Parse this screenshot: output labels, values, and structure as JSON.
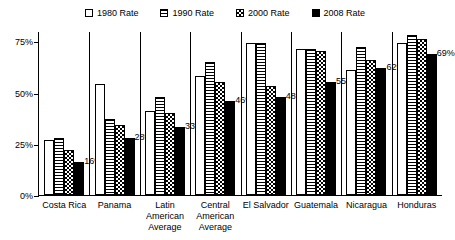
{
  "chart_data": {
    "type": "bar",
    "title": "",
    "subtitle": "",
    "xlabel": "",
    "ylabel": "",
    "ylim": [
      0,
      80
    ],
    "yticks": [
      0,
      25,
      50,
      75
    ],
    "ytick_labels": [
      "0%",
      "25%",
      "50%",
      "75%"
    ],
    "grid": false,
    "legend_position": "top-center",
    "categories": [
      "Costa Rica",
      "Panama",
      "Latin\nAmerican\nAverage",
      "Central\nAmerican\nAverage",
      "El Salvador",
      "Guatemala",
      "Nicaragua",
      "Honduras"
    ],
    "series": [
      {
        "name": "1980 Rate",
        "pattern": "empty",
        "values": [
          27,
          54,
          41,
          58,
          74,
          71,
          61,
          74
        ]
      },
      {
        "name": "1990 Rate",
        "pattern": "horizontal-waves",
        "values": [
          28,
          37,
          48,
          65,
          74,
          71,
          72,
          78
        ]
      },
      {
        "name": "2000 Rate",
        "pattern": "checkerboard",
        "values": [
          22,
          34,
          40,
          55,
          53,
          70,
          66,
          76
        ]
      },
      {
        "name": "2008 Rate",
        "pattern": "solid-black",
        "values": [
          16,
          28,
          33,
          46,
          48,
          55,
          62,
          69
        ],
        "data_labels": [
          "16%",
          "28%",
          "33%",
          "46%",
          "48%",
          "55%",
          "62%",
          "69%"
        ]
      }
    ],
    "annotations": [
      "Data labels shown only on the 2008 Rate series"
    ]
  },
  "legend": {
    "items": [
      {
        "label": "1980 Rate",
        "pattern": "empty"
      },
      {
        "label": "1990 Rate",
        "pattern": "horizontal-waves"
      },
      {
        "label": "2000 Rate",
        "pattern": "checkerboard"
      },
      {
        "label": "2008 Rate",
        "pattern": "solid-black"
      }
    ]
  },
  "colors": {
    "foreground": "#000000",
    "background": "#ffffff"
  }
}
